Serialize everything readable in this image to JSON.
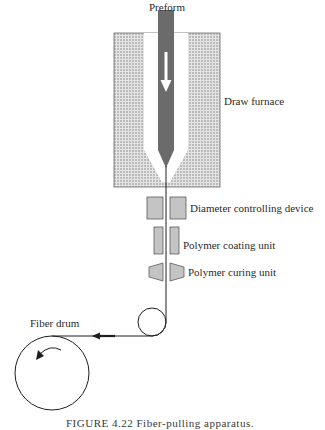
{
  "labels": {
    "preform": "Preform",
    "draw_furnace": "Draw furnace",
    "diameter_device": "Diameter controlling device",
    "coating_unit": "Polymer coating unit",
    "curing_unit": "Polymer curing unit",
    "fiber_drum": "Fiber drum"
  },
  "caption": "FIGURE 4.22   Fiber-pulling apparatus.",
  "colors": {
    "furnace_dots": "#7a7a7a",
    "furnace_bg": "#d9d9d9",
    "preform": "#6e6e6e",
    "unit_fill": "#c4c4c4",
    "unit_stroke": "#5a5a5a",
    "line": "#1e1e1e"
  }
}
